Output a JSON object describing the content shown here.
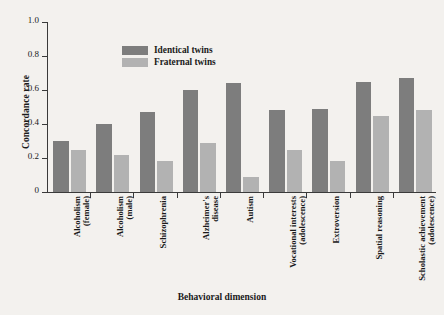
{
  "chart_data": {
    "type": "bar",
    "title": "",
    "xlabel": "Behavioral dimension",
    "ylabel": "Concordance rate",
    "ylim": [
      0,
      1.0
    ],
    "yticks": [
      "0",
      "0.2",
      "0.4",
      "0.6",
      "0.8",
      "1.0"
    ],
    "ytick_values": [
      0,
      0.2,
      0.4,
      0.6,
      0.8,
      1.0
    ],
    "grid": false,
    "legend_position": "top-left-inside",
    "categories": [
      "Alcoholism\n(female)",
      "Alcoholism\n(male)",
      "Schizophrenia",
      "Alzheimer's\ndisease",
      "Autism",
      "Vocational interests\n(adolescence)",
      "Extroversion",
      "Spatial reasoning",
      "Scholastic achievement\n(adolescence)"
    ],
    "series": [
      {
        "name": "Identical twins",
        "color": "#7d7d7d",
        "values": [
          0.3,
          0.4,
          0.47,
          0.6,
          0.64,
          0.48,
          0.49,
          0.65,
          0.67
        ]
      },
      {
        "name": "Fraternal twins",
        "color": "#b2b2b2",
        "values": [
          0.25,
          0.22,
          0.18,
          0.29,
          0.09,
          0.25,
          0.18,
          0.45,
          0.48
        ]
      }
    ]
  },
  "figure": {
    "background_color": "#f3f1ee",
    "axis_color": "#3a3a3a"
  }
}
